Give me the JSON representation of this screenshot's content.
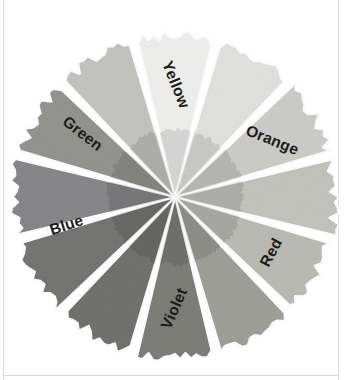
{
  "figure": {
    "kind": "color-wheel",
    "center": {
      "x": 175,
      "y": 197
    },
    "radius": 162,
    "segment_count": 12,
    "background_color": "#ffffff",
    "label_color": "#1b1b1b",
    "gap_color": "#ffffff"
  },
  "chart_data": {
    "type": "pie",
    "title": "",
    "xlabel": "",
    "ylabel": "",
    "legend_position": "none",
    "grid": false,
    "categories": [
      "Yellow",
      "Yellow-Orange",
      "Orange",
      "Red-Orange",
      "Red",
      "Red-Violet",
      "Violet",
      "Blue-Violet",
      "Blue",
      "Blue-Green",
      "Green",
      "Yellow-Green"
    ],
    "values": [
      30,
      30,
      30,
      30,
      30,
      30,
      30,
      30,
      30,
      30,
      30,
      30
    ],
    "value_unit": "degrees",
    "series": [
      {
        "name": "Gray value of printed hue",
        "values": [
          240,
          226,
          205,
          196,
          188,
          160,
          126,
          114,
          118,
          136,
          148,
          196
        ]
      }
    ]
  },
  "segments": [
    {
      "id": "yellow",
      "label": "Yellow",
      "labeled": true,
      "start_angle": -105,
      "end_angle": -75,
      "fill": "#f0f0ee",
      "edge": "#e6e6e3",
      "label_radius": 112,
      "label_angle": -90,
      "label_rotation": 68
    },
    {
      "id": "yellow-orange",
      "label": "",
      "labeled": false,
      "start_angle": -75,
      "end_angle": -45,
      "fill": "#e2e2df",
      "edge": "#d8d8d4",
      "label_radius": 0,
      "label_angle": -60,
      "label_rotation": 0
    },
    {
      "id": "orange",
      "label": "Orange",
      "labeled": true,
      "start_angle": -45,
      "end_angle": -15,
      "fill": "#cdcdc9",
      "edge": "#c4c4bf",
      "label_radius": 112,
      "label_angle": -30,
      "label_rotation": 22
    },
    {
      "id": "red-orange",
      "label": "",
      "labeled": false,
      "start_angle": -15,
      "end_angle": 15,
      "fill": "#c4c4bf",
      "edge": "#bbbbb6",
      "label_radius": 0,
      "label_angle": 0,
      "label_rotation": 0
    },
    {
      "id": "red",
      "label": "Red",
      "labeled": true,
      "start_angle": 15,
      "end_angle": 45,
      "fill": "#bcbcb7",
      "edge": "#b2b2ad",
      "label_radius": 112,
      "label_angle": 30,
      "label_rotation": -62
    },
    {
      "id": "red-violet",
      "label": "",
      "labeled": false,
      "start_angle": 45,
      "end_angle": 75,
      "fill": "#a0a09b",
      "edge": "#969691",
      "label_radius": 0,
      "label_angle": 60,
      "label_rotation": 0
    },
    {
      "id": "violet",
      "label": "Violet",
      "labeled": true,
      "start_angle": 75,
      "end_angle": 105,
      "fill": "#7e7e7a",
      "edge": "#747470",
      "label_radius": 112,
      "label_angle": 90,
      "label_rotation": -66
    },
    {
      "id": "blue-violet",
      "label": "",
      "labeled": false,
      "start_angle": 105,
      "end_angle": 135,
      "fill": "#727270",
      "edge": "#6a6a68",
      "label_radius": 0,
      "label_angle": 120,
      "label_rotation": 0
    },
    {
      "id": "blue",
      "label": "Blue",
      "labeled": true,
      "start_angle": 135,
      "end_angle": 165,
      "fill": "#767674",
      "edge": "#6d6d6b",
      "label_radius": 112,
      "label_angle": 165,
      "label_rotation": -18
    },
    {
      "id": "blue-green",
      "label": "",
      "labeled": false,
      "start_angle": 165,
      "end_angle": 195,
      "fill": "#88888a",
      "edge": "#7e7e80",
      "label_radius": 0,
      "label_angle": 180,
      "label_rotation": 0
    },
    {
      "id": "green",
      "label": "Green",
      "labeled": true,
      "start_angle": 195,
      "end_angle": 225,
      "fill": "#949490",
      "edge": "#8a8a86",
      "label_radius": 112,
      "label_angle": 214,
      "label_rotation": 38
    },
    {
      "id": "yellow-green",
      "label": "",
      "labeled": false,
      "start_angle": 225,
      "end_angle": 255,
      "fill": "#c4c4c0",
      "edge": "#bbbbb7",
      "label_radius": 0,
      "label_angle": 240,
      "label_rotation": 0
    }
  ]
}
